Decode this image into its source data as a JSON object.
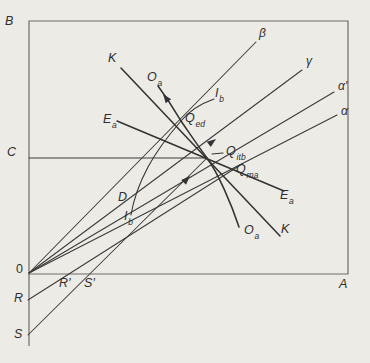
{
  "figure": {
    "type": "offer-curve-trade-diagram",
    "colors": {
      "background": "#edebe6",
      "box_stroke": "#6e6c68",
      "line_stroke": "#3a3a3a",
      "text": "#2e2e2e"
    },
    "labels": {
      "corner_b": "B",
      "corner_a": "A",
      "c": "C",
      "origin": "0",
      "r": "R",
      "s": "S",
      "r_prime": "R′",
      "s_prime": "S′",
      "k": "K",
      "d": "D",
      "beta": "β",
      "gamma": "γ",
      "alpha_prime": "α′",
      "alpha": "α",
      "o_a": {
        "main": "O",
        "sub": "a"
      },
      "e_a": {
        "main": "E",
        "sub": "a"
      },
      "i_b": {
        "main": "I",
        "sub": "b"
      },
      "q_ed": {
        "main": "Q",
        "sub": "ed"
      },
      "q_itb": {
        "main": "Q",
        "sub": "itb"
      },
      "q_ma": {
        "main": "Q",
        "sub": "ma"
      }
    }
  }
}
